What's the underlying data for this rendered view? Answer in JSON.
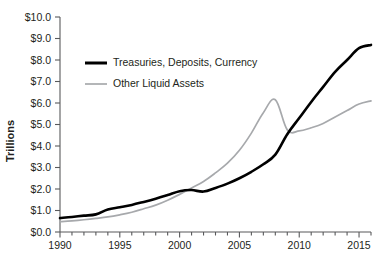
{
  "chart_data": {
    "type": "line",
    "title": "",
    "subtitle": "",
    "xlabel": "",
    "ylabel": "Trillions",
    "xlim": [
      1990,
      2016
    ],
    "ylim": [
      0,
      10
    ],
    "grid": false,
    "legend_position": "top-left-inside",
    "y_tick_labels": [
      "$0.0",
      "$1.0",
      "$2.0",
      "$3.0",
      "$4.0",
      "$5.0",
      "$6.0",
      "$7.0",
      "$8.0",
      "$9.0",
      "$10.0"
    ],
    "y_tick_values": [
      0,
      1,
      2,
      3,
      4,
      5,
      6,
      7,
      8,
      9,
      10
    ],
    "x_tick_labels": [
      "1990",
      "1995",
      "2000",
      "2005",
      "2010",
      "2015"
    ],
    "x_tick_values": [
      1990,
      1995,
      2000,
      2005,
      2010,
      2015
    ],
    "x_minor_tick_step": 1,
    "x": [
      1990,
      1991,
      1992,
      1993,
      1994,
      1995,
      1996,
      1997,
      1998,
      1999,
      2000,
      2001,
      2002,
      2003,
      2004,
      2005,
      2006,
      2007,
      2008,
      2009,
      2010,
      2011,
      2012,
      2013,
      2014,
      2015,
      2016
    ],
    "series": [
      {
        "name": "Treasuries, Deposits, Currency",
        "color": "#000000",
        "width": 2.6,
        "values": [
          0.65,
          0.7,
          0.76,
          0.82,
          1.05,
          1.15,
          1.26,
          1.4,
          1.55,
          1.72,
          1.9,
          1.95,
          1.88,
          2.05,
          2.25,
          2.5,
          2.8,
          3.15,
          3.6,
          4.55,
          5.3,
          6.05,
          6.75,
          7.45,
          8.0,
          8.55,
          8.7
        ]
      },
      {
        "name": "Other Liquid Assets",
        "color": "#a7a9ac",
        "width": 1.7,
        "values": [
          0.48,
          0.52,
          0.57,
          0.63,
          0.7,
          0.8,
          0.92,
          1.08,
          1.25,
          1.48,
          1.75,
          2.05,
          2.35,
          2.75,
          3.2,
          3.8,
          4.6,
          5.55,
          6.15,
          4.75,
          4.7,
          4.85,
          5.05,
          5.35,
          5.65,
          5.95,
          6.1
        ]
      }
    ]
  },
  "legend": {
    "items": [
      {
        "label": "Treasuries, Deposits, Currency",
        "color": "#000000",
        "thickness": 3.0
      },
      {
        "label": "Other Liquid Assets",
        "color": "#a7a9ac",
        "thickness": 1.7
      }
    ]
  },
  "axes": {
    "y_title": "Trillions"
  }
}
